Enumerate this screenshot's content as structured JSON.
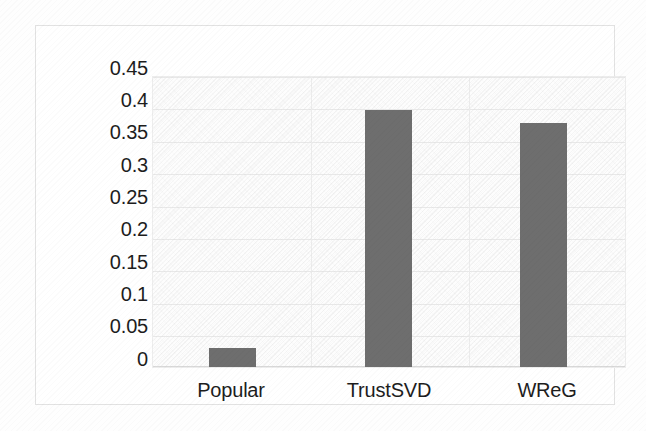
{
  "chart_data": {
    "type": "bar",
    "title": "",
    "subtitle": "",
    "xlabel": "",
    "ylabel": "",
    "categories": [
      "Popular",
      "TrustSVD",
      "WReG"
    ],
    "values": [
      0.03,
      0.4,
      0.38
    ],
    "series": [
      {
        "name": "",
        "values": [
          0.03,
          0.4,
          0.38
        ]
      }
    ],
    "ylim": [
      0,
      0.45
    ],
    "ytick_labels": [
      "0.45",
      "0.4",
      "0.35",
      "0.3",
      "0.25",
      "0.2",
      "0.15",
      "0.1",
      "0.05",
      "0"
    ],
    "ytick_values": [
      0.45,
      0.4,
      0.35,
      0.3,
      0.25,
      0.2,
      0.15,
      0.1,
      0.05,
      0
    ],
    "ytick_step": 0.05,
    "grid": {
      "horizontal": true,
      "vertical": true
    },
    "legend": {
      "visible": false,
      "position": "none",
      "entries": []
    },
    "annotations": [],
    "data_labels_visible": false,
    "bar_color": "#6e6e6e",
    "plot_background": "#fdfdfd",
    "gridline_color": "#e8e8e8",
    "frame_border_color": "#e2e2e2",
    "axis_text_color": "#1d1d1d"
  }
}
